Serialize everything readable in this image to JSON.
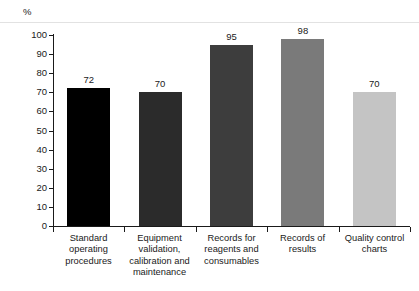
{
  "chart_data": {
    "type": "bar",
    "title": "",
    "subtitle": "",
    "xlabel": "",
    "ylabel": "%",
    "ylim": [
      0,
      100
    ],
    "ytick_step": 10,
    "grid": false,
    "legend": null,
    "categories": [
      "Standard operating procedures",
      "Equipment validation, calibration and maintenance",
      "Records for reagents and consumables",
      "Records of results",
      "Quality control charts"
    ],
    "category_lines": [
      [
        "Standard",
        "operating",
        "procedures"
      ],
      [
        "Equipment",
        "validation,",
        "calibration and",
        "maintenance"
      ],
      [
        "Records for",
        "reagents and",
        "consumables"
      ],
      [
        "Records of",
        "results"
      ],
      [
        "Quality control",
        "charts"
      ]
    ],
    "values": [
      72,
      70,
      95,
      98,
      70
    ],
    "value_labels": [
      "72",
      "70",
      "95",
      "98",
      "70"
    ],
    "bar_colors": [
      "#000000",
      "#2b2b2b",
      "#3d3d3d",
      "#7a7a7a",
      "#c4c4c4"
    ],
    "ytick_labels": [
      "0",
      "10",
      "20",
      "30",
      "40",
      "50",
      "60",
      "70",
      "80",
      "90",
      "100"
    ],
    "axis_color": "#1a1a1a"
  }
}
